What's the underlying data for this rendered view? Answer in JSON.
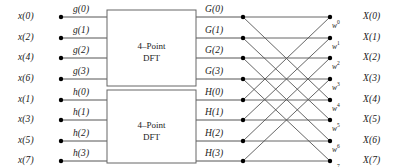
{
  "figure": {
    "type": "signal-flow-graph"
  },
  "inputs": {
    "label": "time-domain samples",
    "items": [
      {
        "name": "x(0)",
        "row": 0
      },
      {
        "name": "x(2)",
        "row": 1
      },
      {
        "name": "x(4)",
        "row": 2
      },
      {
        "name": "x(6)",
        "row": 3
      },
      {
        "name": "x(1)",
        "row": 4
      },
      {
        "name": "x(3)",
        "row": 5
      },
      {
        "name": "x(5)",
        "row": 6
      },
      {
        "name": "x(7)",
        "row": 7
      }
    ]
  },
  "sequences": {
    "even": [
      "g(0)",
      "g(1)",
      "g(2)",
      "g(3)"
    ],
    "odd": [
      "h(0)",
      "h(1)",
      "h(2)",
      "h(3)"
    ]
  },
  "blocks": [
    {
      "id": "top-dft",
      "line1": "4–Point",
      "line2": "DFT"
    },
    {
      "id": "bottom-dft",
      "line1": "4–Point",
      "line2": "DFT"
    }
  ],
  "intermediate": {
    "even_outputs": [
      "G(0)",
      "G(1)",
      "G(2)",
      "G(3)"
    ],
    "odd_outputs": [
      "H(0)",
      "H(1)",
      "H(2)",
      "H(3)"
    ]
  },
  "twiddles": {
    "base": "w",
    "exponents": [
      "0",
      "1",
      "2",
      "3",
      "4",
      "5",
      "6",
      "7"
    ]
  },
  "outputs": {
    "label": "frequency-domain samples",
    "items": [
      {
        "name": "X(0)",
        "row": 0
      },
      {
        "name": "X(1)",
        "row": 1
      },
      {
        "name": "X(2)",
        "row": 2
      },
      {
        "name": "X(3)",
        "row": 3
      },
      {
        "name": "X(4)",
        "row": 4
      },
      {
        "name": "X(5)",
        "row": 5
      },
      {
        "name": "X(6)",
        "row": 6
      },
      {
        "name": "X(7)",
        "row": 7
      }
    ]
  },
  "colors": {
    "line": "#555555",
    "node": "#000000",
    "box_border": "#666666",
    "text": "#1a1a1a",
    "background": "#ffffff"
  },
  "geometry": {
    "row_y": [
      17,
      38,
      58,
      79,
      100,
      120,
      141,
      161
    ],
    "input_node_x": 61,
    "box_left": 107,
    "box_right": 196,
    "mid_node_x": 243,
    "out_node_x": 330
  },
  "connections": {
    "note": "Each left node k drives its own output row and the row offset by 4 (radix-2 combine).",
    "edges": [
      [
        0,
        0
      ],
      [
        0,
        4
      ],
      [
        1,
        1
      ],
      [
        1,
        5
      ],
      [
        2,
        2
      ],
      [
        2,
        6
      ],
      [
        3,
        3
      ],
      [
        3,
        7
      ],
      [
        4,
        0
      ],
      [
        4,
        4
      ],
      [
        5,
        1
      ],
      [
        5,
        5
      ],
      [
        6,
        2
      ],
      [
        6,
        6
      ],
      [
        7,
        3
      ],
      [
        7,
        7
      ]
    ]
  }
}
